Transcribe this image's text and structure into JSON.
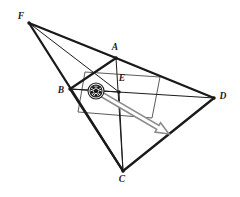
{
  "figure": {
    "canvas": {
      "width": 240,
      "height": 197,
      "background": "#ffffff"
    },
    "ink_color": "#1a1a1a",
    "thin_color": "#4a4a4a",
    "arrow_color": "#8d8d8d",
    "points": [
      {
        "name": "F",
        "label": "F",
        "x": 29,
        "y": 23,
        "label_x": 21,
        "label_y": 19
      },
      {
        "name": "A",
        "label": "A",
        "x": 116,
        "y": 58,
        "label_x": 115,
        "label_y": 50
      },
      {
        "name": "B",
        "label": "B",
        "x": 70,
        "y": 89,
        "label_x": 61,
        "label_y": 93
      },
      {
        "name": "E",
        "label": "E",
        "x": 119,
        "y": 92,
        "label_x": 122,
        "label_y": 81
      },
      {
        "name": "D",
        "label": "D",
        "x": 214,
        "y": 98,
        "label_x": 223,
        "label_y": 99
      },
      {
        "name": "C",
        "label": "C",
        "x": 123,
        "y": 171,
        "label_x": 122,
        "label_y": 182
      }
    ],
    "outer_edges": [
      {
        "name": "edge-B-A",
        "from": "B",
        "to": "A"
      },
      {
        "name": "edge-A-D",
        "from": "A",
        "to": "D"
      },
      {
        "name": "edge-D-C",
        "from": "D",
        "to": "C"
      },
      {
        "name": "edge-C-B",
        "from": "C",
        "to": "B"
      },
      {
        "name": "edge-F-A",
        "from": "F",
        "to": "A"
      },
      {
        "name": "edge-F-C",
        "from": "F",
        "to": "C"
      }
    ],
    "diagonals": [
      {
        "name": "diagonal-A-C",
        "from": "A",
        "to": "C"
      },
      {
        "name": "diagonal-B-D",
        "from": "B",
        "to": "D"
      },
      {
        "name": "ray-F-E",
        "from": "F",
        "to": "E"
      },
      {
        "name": "ray-F-D",
        "from": "F",
        "to": "D"
      },
      {
        "name": "ray-E-B",
        "from": "E",
        "to": "B"
      },
      {
        "name": "ray-E-C",
        "from": "E",
        "to": "C"
      }
    ],
    "inner_quad": {
      "name": "inner-quadrilateral",
      "vertices": [
        {
          "x": 85,
          "y": 72
        },
        {
          "x": 160,
          "y": 77
        },
        {
          "x": 152,
          "y": 118
        },
        {
          "x": 78,
          "y": 112
        }
      ]
    },
    "ball": {
      "name": "soccer-ball",
      "cx": 96,
      "cy": 91,
      "r_outer": 8.0,
      "r_inner": 6.0,
      "fill": "#ffffff",
      "patch_fill": "#1a1a1a"
    },
    "motion_arrow": {
      "name": "motion-arrow",
      "from_x": 101,
      "from_y": 94,
      "to_x": 169,
      "to_y": 134,
      "shaft_width": 4.5,
      "head_length": 13,
      "head_width": 11,
      "stroke": "#8d8d8d",
      "fill": "#ffffff"
    }
  }
}
